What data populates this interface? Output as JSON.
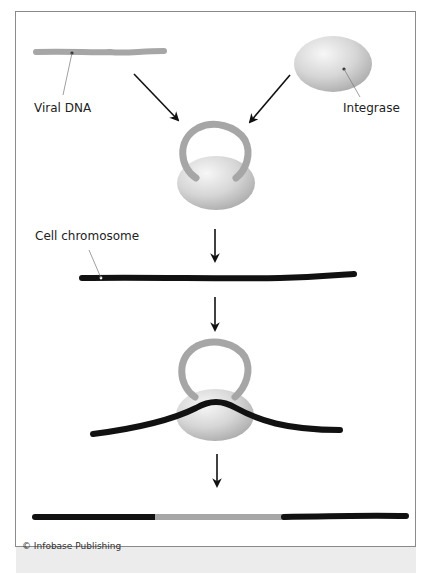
{
  "labels": {
    "viral_dna": "Viral DNA",
    "integrase": "Integrase",
    "cell_chromosome": "Cell chromosome"
  },
  "credit": "© Infobase Publishing",
  "colors": {
    "viral_dna": "#a6a6a6",
    "chromosome": "#111111",
    "integrase_light": "#f2f2f2",
    "integrase_dark": "#b8b8b8",
    "arrow": "#111111",
    "frame_border": "#8a8a8a",
    "leader_line": "#777777"
  },
  "steps": [
    {
      "id": 1,
      "description": "Viral DNA and Integrase separate"
    },
    {
      "id": 2,
      "description": "Integrase binds both ends of viral DNA forming a loop"
    },
    {
      "id": 3,
      "description": "Cell chromosome"
    },
    {
      "id": 4,
      "description": "Integrase–viral DNA complex binds and bends the cell chromosome"
    },
    {
      "id": 5,
      "description": "Viral DNA integrated into the cell chromosome"
    }
  ]
}
